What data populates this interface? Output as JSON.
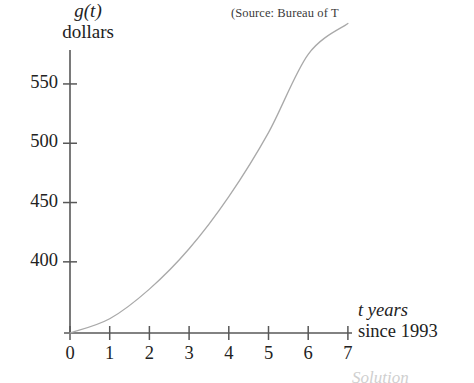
{
  "figure": {
    "source_note": "(Source: Bureau of T",
    "bottom_caption": "Solution"
  },
  "chart_data": {
    "type": "line",
    "title": "",
    "subtitle": "",
    "xlabel_line1": "t years",
    "xlabel_line2": "since 1993",
    "ylabel_line1": "g(t)",
    "ylabel_line2": "dollars",
    "x": [
      0,
      1,
      2,
      3,
      4,
      5,
      6,
      7
    ],
    "values": [
      340,
      352,
      377,
      411,
      455,
      509,
      575,
      601
    ],
    "xticks": [
      0,
      1,
      2,
      3,
      4,
      5,
      6,
      7
    ],
    "xtick_labels": [
      "0",
      "1",
      "2",
      "3",
      "4",
      "5",
      "6",
      "7"
    ],
    "yticks": [
      400,
      450,
      500,
      550
    ],
    "ytick_labels": [
      "400",
      "450",
      "500",
      "550"
    ],
    "xlim": [
      0,
      7
    ],
    "ylim": [
      340,
      610
    ],
    "grid": false,
    "legend": false,
    "curve_color": "#a9a9a9",
    "axis_color": "#585858",
    "text_color": "#222222",
    "background_color": "#ffffff",
    "annotations": []
  },
  "axis_geometry": {
    "x_origin_px": 70,
    "y_baseline_px": 333,
    "px_per_x_unit": 39.7,
    "px_per_50_dollars": 59.3,
    "y_axis_top_px": 50,
    "x_axis_right_px": 352
  }
}
